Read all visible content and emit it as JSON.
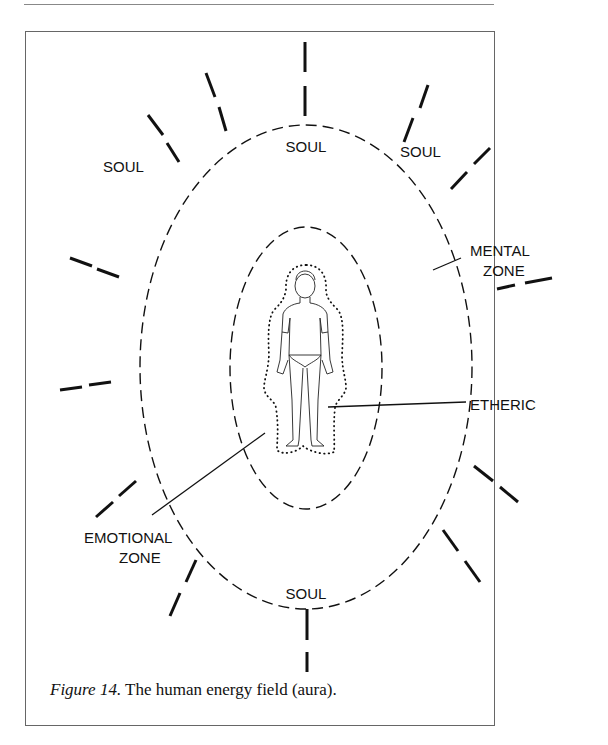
{
  "diagram": {
    "labels": {
      "soul_top": "SOUL",
      "soul_upper_right": "SOUL",
      "soul_upper_left": "SOUL",
      "soul_bottom": "SOUL",
      "mental_line1": "MENTAL",
      "mental_line2": "ZONE",
      "etheric": "ETHERIC",
      "emotional_line1": "EMOTIONAL",
      "emotional_line2": "ZONE"
    }
  },
  "caption": {
    "figure_label": "Figure 14.",
    "text": " The human energy field (aura)."
  }
}
